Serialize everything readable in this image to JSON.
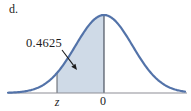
{
  "figure": {
    "part_label": "d.",
    "annotation": {
      "label": "0.4625"
    },
    "axis": {
      "tick_z": "z",
      "tick_zero": "0"
    }
  },
  "colors": {
    "curve": "#5373a9",
    "shade": "#cfdae7",
    "axis_line": "#8e8e96",
    "zero_line": "#4a5260",
    "tick_line": "#5a5f66",
    "arrow": "#1c1c1c",
    "text": "#1c1c1c",
    "background": "#ffffff"
  },
  "chart_data": {
    "type": "area",
    "title": "",
    "x_tick_labels": [
      "z",
      "0"
    ],
    "shaded_region": {
      "from_label": "z",
      "to_label": "0",
      "area": 0.4625
    },
    "annotations": [
      {
        "text": "0.4625",
        "target": "shaded region between z and 0"
      }
    ],
    "layout": {
      "peak_x": 104,
      "peak_y": 15,
      "baseline_y": 93,
      "sigma": 28.5,
      "curve_x_start": 8,
      "curve_x_end": 185,
      "axis_x_start": 8,
      "axis_x_end": 187,
      "z_x": 57,
      "arrow": {
        "x1": 62,
        "y1": 50,
        "x2": 77,
        "y2": 70
      },
      "curve_stroke_width": 2.2
    }
  }
}
